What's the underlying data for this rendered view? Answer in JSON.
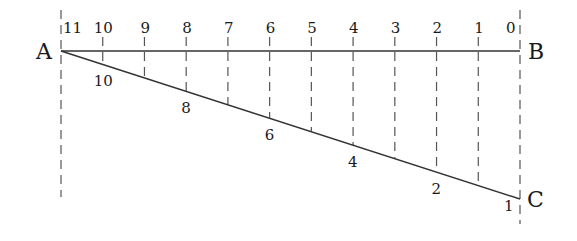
{
  "diagram": {
    "points": {
      "A": {
        "label": "A",
        "x": 61,
        "y": 51
      },
      "B": {
        "label": "B",
        "x": 520,
        "y": 51
      },
      "C": {
        "label": "C",
        "x": 520,
        "y": 199
      }
    },
    "top_labels": [
      "11",
      "10",
      "9",
      "8",
      "7",
      "6",
      "5",
      "4",
      "3",
      "2",
      "1",
      "0"
    ],
    "bottom_labels": [
      {
        "text": "10",
        "index": 1
      },
      {
        "text": "8",
        "index": 3
      },
      {
        "text": "6",
        "index": 5
      },
      {
        "text": "4",
        "index": 7
      },
      {
        "text": "2",
        "index": 9
      },
      {
        "text": "1",
        "index": 11
      }
    ],
    "colors": {
      "line": "#333333",
      "dash": "#555555",
      "text": "#1a1a1a"
    }
  }
}
